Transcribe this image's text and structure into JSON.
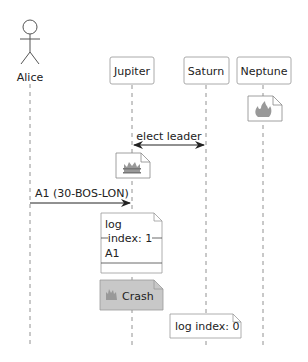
{
  "diagram": {
    "type": "sequence",
    "participants": [
      {
        "id": "alice",
        "label": "Alice",
        "kind": "actor"
      },
      {
        "id": "jupiter",
        "label": "Jupiter",
        "kind": "participant"
      },
      {
        "id": "saturn",
        "label": "Saturn",
        "kind": "participant"
      },
      {
        "id": "neptune",
        "label": "Neptune",
        "kind": "participant"
      }
    ],
    "events": [
      {
        "type": "note-icon",
        "over": "neptune",
        "icon": "fire-icon"
      },
      {
        "type": "message",
        "from": "jupiter",
        "to": "saturn",
        "label": "elect leader",
        "bidirectional": true
      },
      {
        "type": "note-icon",
        "over": "jupiter",
        "icon": "crown-icon"
      },
      {
        "type": "message",
        "from": "alice",
        "to": "jupiter",
        "label": "A1 (30-BOS-LON)"
      },
      {
        "type": "note",
        "over": "jupiter",
        "lines": [
          "log",
          "index: 1",
          "A1"
        ]
      },
      {
        "type": "note",
        "over": "jupiter",
        "label": "Crash",
        "icon": "fire-icon",
        "style": "gray"
      },
      {
        "type": "note",
        "over": "saturn",
        "label": "log index: 0"
      }
    ]
  },
  "labels": {
    "alice": "Alice",
    "jupiter": "Jupiter",
    "saturn": "Saturn",
    "neptune": "Neptune",
    "elect_leader": "elect leader",
    "a1_message": "A1 (30-BOS-LON)",
    "log_title": "log",
    "log_divider": "index: 1",
    "log_entry": "A1",
    "crash": "Crash",
    "saturn_log": "log index: 0"
  },
  "colors": {
    "line": "#555555",
    "box_border": "#aaaaaa",
    "crash_fill": "#c8c8c8",
    "icon_gray": "#888888"
  }
}
